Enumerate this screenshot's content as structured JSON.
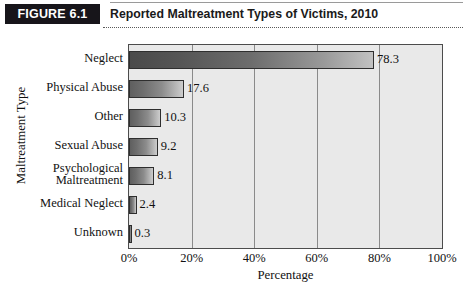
{
  "figure": {
    "badge": "FIGURE 6.1",
    "title": "Reported Maltreatment Types of Victims, 2010"
  },
  "chart_data": {
    "type": "bar",
    "orientation": "horizontal",
    "title": "Reported Maltreatment Types of Victims, 2010",
    "xlabel": "Percentage",
    "ylabel": "Maltreatment Type",
    "xlim": [
      0,
      100
    ],
    "xticks": [
      "0%",
      "20%",
      "40%",
      "60%",
      "80%",
      "100%"
    ],
    "xtick_values": [
      0,
      20,
      40,
      60,
      80,
      100
    ],
    "grid": true,
    "legend": null,
    "categories": [
      "Neglect",
      "Physical Abuse",
      "Other",
      "Sexual Abuse",
      "Psychological Maltreatment",
      "Medical Neglect",
      "Unknown"
    ],
    "category_lines": [
      [
        "Neglect"
      ],
      [
        "Physical Abuse"
      ],
      [
        "Other"
      ],
      [
        "Sexual Abuse"
      ],
      [
        "Psychological",
        "Maltreatment"
      ],
      [
        "Medical Neglect"
      ],
      [
        "Unknown"
      ]
    ],
    "values": [
      78.3,
      17.6,
      10.3,
      9.2,
      8.1,
      2.4,
      0.3
    ],
    "value_labels": [
      "78.3",
      "17.6",
      "10.3",
      "9.2",
      "8.1",
      "2.4",
      "0.3"
    ],
    "colors": {
      "plot_background": "#e9e9e9",
      "bar_border": "#2e2e2e",
      "bar_gradient_start": "#4a4a4a",
      "bar_gradient_end": "#cdcdcd",
      "frame": "#4c4c4c",
      "gridline": "#8a8a8a",
      "badge_background": "#17151a",
      "badge_text": "#ffffff"
    }
  }
}
